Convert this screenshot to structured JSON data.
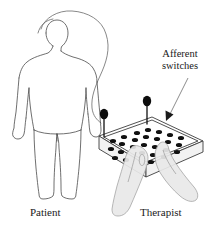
{
  "figure": {
    "background_color": "#ffffff",
    "width": 214,
    "height": 235
  },
  "labels": {
    "afferent_switches": "Afferent switches",
    "patient": "Patient",
    "therapist": "Therapist"
  },
  "colors": {
    "outline": "#4a4a4a",
    "panel_outline": "#3d3d3d",
    "switch_dot": "#111111",
    "hand_fill": "#e8e8e8",
    "cable": "#6a6a6a",
    "text": "#1a1a1a"
  },
  "elements": {
    "patient_figure": "human-outline-back-view",
    "cable": "electrode-cable-loop",
    "panel": "isometric-switch-box",
    "levers": 2,
    "switch_dot_count": 26,
    "hands": 2,
    "callout_arrow": "arrow-pointing-to-panel"
  }
}
